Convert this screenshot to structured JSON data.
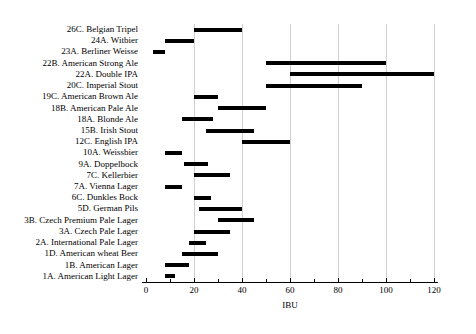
{
  "chart_data": {
    "type": "bar",
    "orientation": "horizontal",
    "subtype": "range-bar",
    "title": "",
    "xlabel": "IBU",
    "ylabel": "",
    "xlim": [
      -3,
      123
    ],
    "xticks": [
      0,
      20,
      40,
      60,
      80,
      100,
      120
    ],
    "xticklabels": [
      "0",
      "20",
      "40",
      "60",
      "80",
      "100",
      "120"
    ],
    "minor_tick_interval": 10,
    "grid": "vertical-only",
    "legend": "none",
    "bar_color": "#000000",
    "gridline_color": "#cfcfcf",
    "categories": [
      "26C. Belgian Tripel",
      "24A. Witbier",
      "23A. Berliner Weisse",
      "22B. American Strong Ale",
      "22A. Double IPA",
      "20C. Imperial Stout",
      "19C. American Brown Ale",
      "18B. American Pale Ale",
      "18A. Blonde Ale",
      "15B. Irish Stout",
      "12C. English IPA",
      "10A. Weissbier",
      "9A. Doppelbock",
      "7C. Kellerbier",
      "7A. Vienna Lager",
      "6C. Dunkles Bock",
      "5D. German Pils",
      "3B. Czech Premium Pale Lager",
      "3A. Czech Pale Lager",
      "2A. International Pale Lager",
      "1D. American wheat Beer",
      "1B. American Lager",
      "1A. American Light Lager"
    ],
    "ranges": [
      {
        "category": "26C. Belgian Tripel",
        "low": 20,
        "high": 40
      },
      {
        "category": "24A. Witbier",
        "low": 8,
        "high": 20
      },
      {
        "category": "23A. Berliner Weisse",
        "low": 3,
        "high": 8
      },
      {
        "category": "22B. American Strong Ale",
        "low": 50,
        "high": 100
      },
      {
        "category": "22A. Double IPA",
        "low": 60,
        "high": 120
      },
      {
        "category": "20C. Imperial Stout",
        "low": 50,
        "high": 90
      },
      {
        "category": "19C. American Brown Ale",
        "low": 20,
        "high": 30
      },
      {
        "category": "18B. American Pale Ale",
        "low": 30,
        "high": 50
      },
      {
        "category": "18A. Blonde Ale",
        "low": 15,
        "high": 28
      },
      {
        "category": "15B. Irish Stout",
        "low": 25,
        "high": 45
      },
      {
        "category": "12C. English IPA",
        "low": 40,
        "high": 60
      },
      {
        "category": "10A. Weissbier",
        "low": 8,
        "high": 15
      },
      {
        "category": "9A. Doppelbock",
        "low": 16,
        "high": 26
      },
      {
        "category": "7C. Kellerbier",
        "low": 20,
        "high": 35
      },
      {
        "category": "7A. Vienna Lager",
        "low": 8,
        "high": 15
      },
      {
        "category": "6C. Dunkles Bock",
        "low": 20,
        "high": 27
      },
      {
        "category": "5D. German Pils",
        "low": 22,
        "high": 40
      },
      {
        "category": "3B. Czech Premium Pale Lager",
        "low": 30,
        "high": 45
      },
      {
        "category": "3A. Czech Pale Lager",
        "low": 20,
        "high": 35
      },
      {
        "category": "2A. International Pale Lager",
        "low": 18,
        "high": 25
      },
      {
        "category": "1D. American wheat Beer",
        "low": 15,
        "high": 30
      },
      {
        "category": "1B. American Lager",
        "low": 8,
        "high": 18
      },
      {
        "category": "1A. American Light Lager",
        "low": 8,
        "high": 12
      }
    ]
  }
}
